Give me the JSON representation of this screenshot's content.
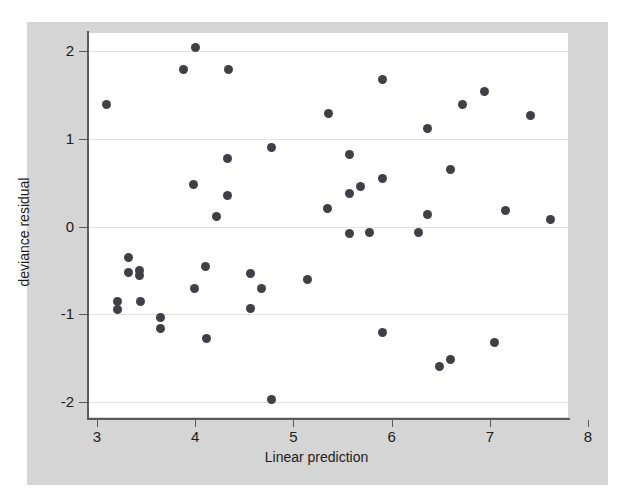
{
  "chart_data": {
    "type": "scatter",
    "title": "",
    "xlabel": "Linear prediction",
    "ylabel": "deviance residual",
    "xlim": [
      2.92,
      8.12
    ],
    "ylim": [
      -2.15,
      2.15
    ],
    "xticks": [
      3,
      4,
      5,
      6,
      7,
      8
    ],
    "xtick_labels": [
      "3",
      "4",
      "5",
      "6",
      "7",
      "8"
    ],
    "yticks": [
      2,
      1,
      0,
      -1,
      -2
    ],
    "ytick_labels": [
      "2",
      "1",
      "0",
      "-1",
      "-2"
    ],
    "grid": "horizontal",
    "legend": null,
    "marker": {
      "shape": "circle",
      "color": "#3f3f46",
      "size": 9
    },
    "background": {
      "figure": "#d5d5d5",
      "panel": "#ffffff",
      "gridline": "#e2e2e2",
      "axis": "#5a5a5a"
    },
    "n_points": 48,
    "points": [
      {
        "x": 3.1,
        "y": 1.39
      },
      {
        "x": 3.21,
        "y": -0.85
      },
      {
        "x": 3.21,
        "y": -0.94
      },
      {
        "x": 3.32,
        "y": -0.35
      },
      {
        "x": 3.32,
        "y": -0.52
      },
      {
        "x": 3.43,
        "y": -0.5
      },
      {
        "x": 3.43,
        "y": -0.56
      },
      {
        "x": 3.44,
        "y": -0.85
      },
      {
        "x": 3.65,
        "y": -1.04
      },
      {
        "x": 3.65,
        "y": -1.16
      },
      {
        "x": 3.88,
        "y": 1.79
      },
      {
        "x": 3.98,
        "y": 0.48
      },
      {
        "x": 3.99,
        "y": -0.71
      },
      {
        "x": 4.0,
        "y": 2.04
      },
      {
        "x": 4.1,
        "y": -0.46
      },
      {
        "x": 4.11,
        "y": -1.28
      },
      {
        "x": 4.22,
        "y": 0.11
      },
      {
        "x": 4.33,
        "y": 0.78
      },
      {
        "x": 4.33,
        "y": 0.35
      },
      {
        "x": 4.34,
        "y": 1.79
      },
      {
        "x": 4.56,
        "y": -0.53
      },
      {
        "x": 4.56,
        "y": -0.93
      },
      {
        "x": 4.68,
        "y": -0.71
      },
      {
        "x": 4.78,
        "y": 0.9
      },
      {
        "x": 4.78,
        "y": -1.97
      },
      {
        "x": 5.14,
        "y": -0.6
      },
      {
        "x": 5.35,
        "y": 0.21
      },
      {
        "x": 5.36,
        "y": 1.29
      },
      {
        "x": 5.57,
        "y": 0.82
      },
      {
        "x": 5.57,
        "y": 0.38
      },
      {
        "x": 5.57,
        "y": -0.08
      },
      {
        "x": 5.68,
        "y": 0.45
      },
      {
        "x": 5.78,
        "y": -0.07
      },
      {
        "x": 5.91,
        "y": 1.67
      },
      {
        "x": 5.91,
        "y": 0.55
      },
      {
        "x": 5.91,
        "y": -1.21
      },
      {
        "x": 6.27,
        "y": -0.07
      },
      {
        "x": 6.37,
        "y": 1.12
      },
      {
        "x": 6.37,
        "y": 0.14
      },
      {
        "x": 6.49,
        "y": -1.59
      },
      {
        "x": 6.6,
        "y": 0.65
      },
      {
        "x": 6.6,
        "y": -1.51
      },
      {
        "x": 6.72,
        "y": 1.39
      },
      {
        "x": 6.95,
        "y": 1.54
      },
      {
        "x": 7.05,
        "y": -1.32
      },
      {
        "x": 7.16,
        "y": 0.18
      },
      {
        "x": 7.41,
        "y": 1.26
      },
      {
        "x": 7.62,
        "y": 0.08
      }
    ]
  }
}
